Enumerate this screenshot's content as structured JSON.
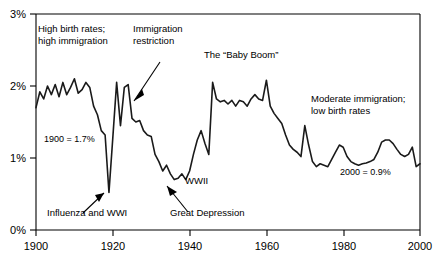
{
  "chart_data": {
    "type": "line",
    "title": "",
    "xlabel": "",
    "ylabel": "",
    "xlim": [
      1900,
      2000
    ],
    "ylim": [
      0,
      3
    ],
    "grid": false,
    "legend_position": "none",
    "y_tick_labels": [
      "0%",
      "1%",
      "2%",
      "3%"
    ],
    "y_ticks": [
      0,
      1,
      2,
      3
    ],
    "x_tick_labels": [
      "1900",
      "1920",
      "1940",
      "1960",
      "1980",
      "2000"
    ],
    "x_ticks": [
      1900,
      1920,
      1940,
      1960,
      1980,
      2000
    ],
    "series": [
      {
        "name": "Annual population growth rate",
        "x": [
          1900,
          1901,
          1902,
          1903,
          1904,
          1905,
          1906,
          1907,
          1908,
          1909,
          1910,
          1911,
          1912,
          1913,
          1914,
          1915,
          1916,
          1917,
          1918,
          1919,
          1920,
          1921,
          1922,
          1923,
          1924,
          1925,
          1926,
          1927,
          1928,
          1929,
          1930,
          1931,
          1932,
          1933,
          1934,
          1935,
          1936,
          1937,
          1938,
          1939,
          1940,
          1941,
          1942,
          1943,
          1944,
          1945,
          1946,
          1947,
          1948,
          1949,
          1950,
          1951,
          1952,
          1953,
          1954,
          1955,
          1956,
          1957,
          1958,
          1959,
          1960,
          1961,
          1962,
          1963,
          1964,
          1965,
          1966,
          1967,
          1968,
          1969,
          1970,
          1971,
          1972,
          1973,
          1974,
          1975,
          1976,
          1977,
          1978,
          1979,
          1980,
          1981,
          1982,
          1983,
          1984,
          1985,
          1986,
          1987,
          1988,
          1989,
          1990,
          1991,
          1992,
          1993,
          1994,
          1995,
          1996,
          1997,
          1998,
          1999,
          2000
        ],
        "values": [
          1.7,
          1.92,
          1.82,
          2.0,
          1.88,
          2.02,
          1.85,
          2.05,
          1.88,
          1.98,
          2.1,
          1.9,
          1.95,
          2.05,
          1.98,
          1.72,
          1.6,
          1.38,
          1.32,
          0.52,
          1.28,
          2.05,
          1.45,
          1.98,
          2.02,
          1.55,
          1.5,
          1.52,
          1.38,
          1.32,
          1.3,
          1.05,
          0.95,
          0.82,
          0.9,
          0.78,
          0.7,
          0.72,
          0.78,
          0.7,
          0.82,
          1.05,
          1.25,
          1.38,
          1.2,
          1.05,
          2.05,
          1.82,
          1.78,
          1.8,
          1.75,
          1.8,
          1.72,
          1.8,
          1.78,
          1.72,
          1.82,
          1.88,
          1.82,
          1.8,
          2.08,
          1.72,
          1.62,
          1.55,
          1.48,
          1.32,
          1.18,
          1.12,
          1.08,
          1.02,
          1.45,
          1.18,
          0.95,
          0.88,
          0.92,
          0.9,
          0.88,
          0.98,
          1.08,
          1.18,
          1.15,
          1.02,
          0.95,
          0.92,
          0.9,
          0.92,
          0.93,
          0.95,
          0.98,
          1.08,
          1.22,
          1.25,
          1.25,
          1.2,
          1.12,
          1.05,
          1.02,
          1.05,
          1.15,
          0.88,
          0.92
        ]
      }
    ],
    "annotations": [
      {
        "id": "high-birth-rates",
        "lines": [
          "High birth rates;",
          "high immigration"
        ],
        "x_px": 38,
        "y_px": 32,
        "has_arrow": false
      },
      {
        "id": "immigration-restriction",
        "lines": [
          "Immigration",
          "restriction"
        ],
        "x_px": 133,
        "y_px": 32,
        "has_arrow": true
      },
      {
        "id": "baby-boom",
        "lines": [
          "The “Baby Boom”"
        ],
        "x_px": 204,
        "y_px": 58,
        "has_arrow": false
      },
      {
        "id": "moderate-immigration",
        "lines": [
          "Moderate immigration;",
          "low birth rates"
        ],
        "x_px": 311,
        "y_px": 102,
        "has_arrow": false
      },
      {
        "id": "influenza-wwi",
        "lines": [
          "Influenza and WWI"
        ],
        "x_px": 47,
        "y_px": 216,
        "has_arrow": true
      },
      {
        "id": "great-depression",
        "lines": [
          "Great Depression"
        ],
        "x_px": 170,
        "y_px": 216,
        "has_arrow": true
      },
      {
        "id": "wwii",
        "lines": [
          "WWII"
        ],
        "x_px": 185,
        "y_px": 184,
        "has_arrow": false
      }
    ],
    "value_notes": [
      {
        "id": "note-1900",
        "text": "1900 = 1.7%",
        "x_px": 44,
        "y_px": 142
      },
      {
        "id": "note-2000",
        "text": "2000 = 0.9%",
        "x_px": 340,
        "y_px": 175
      }
    ]
  },
  "colors": {
    "line": "#1a1a1a",
    "axis": "#000000",
    "background": "#ffffff",
    "text": "#000000"
  }
}
